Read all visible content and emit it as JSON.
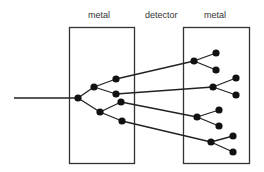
{
  "labels": {
    "left_box": "metal",
    "gap": "detector",
    "right_box": "metal"
  },
  "colors": {
    "line": "#222222",
    "node": "#111111"
  },
  "tree": {
    "description": "A single incoming track enters the left metal block and branches into a shower; four secondary tracks cross the detector gap and each splits in two inside the right metal block.",
    "levels": [
      {
        "name": "incoming-track",
        "count": 1
      },
      {
        "name": "primary-vertex",
        "count": 1
      },
      {
        "name": "first-split",
        "count": 2
      },
      {
        "name": "second-split",
        "count": 4
      },
      {
        "name": "right-block-vertices",
        "count": 4
      },
      {
        "name": "leaves",
        "count": 8
      }
    ]
  }
}
